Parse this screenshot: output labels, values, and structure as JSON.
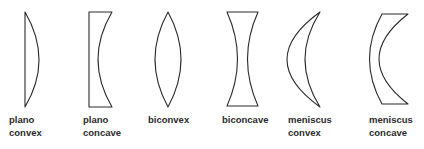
{
  "diagram": {
    "stroke_color": "#2a2a2a",
    "lenses": [
      {
        "id": "plano-convex",
        "label_lines": [
          "plano",
          "convex"
        ]
      },
      {
        "id": "plano-concave",
        "label_lines": [
          "plano",
          "concave"
        ]
      },
      {
        "id": "biconvex",
        "label_lines": [
          "biconvex"
        ]
      },
      {
        "id": "biconcave",
        "label_lines": [
          "biconcave"
        ]
      },
      {
        "id": "meniscus-convex",
        "label_lines": [
          "meniscus",
          "convex"
        ]
      },
      {
        "id": "meniscus-concave",
        "label_lines": [
          "meniscus",
          "concave"
        ]
      }
    ]
  }
}
